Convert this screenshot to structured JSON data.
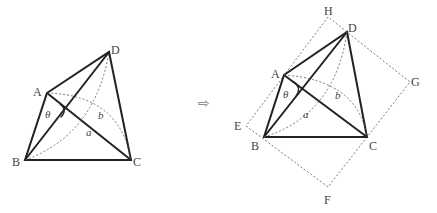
{
  "left_figure": {
    "points": {
      "A": {
        "label": "A",
        "x": 47,
        "y": 93
      },
      "B": {
        "label": "B",
        "x": 25,
        "y": 160
      },
      "C": {
        "label": "C",
        "x": 131,
        "y": 160
      },
      "D": {
        "label": "D",
        "x": 109,
        "y": 52
      }
    },
    "angle_label": "θ",
    "diagonal_a_label": "a",
    "diagonal_b_label": "b"
  },
  "transition_arrow": "⇨",
  "right_figure": {
    "points": {
      "A": {
        "label": "A",
        "x": 284,
        "y": 75
      },
      "B": {
        "label": "B",
        "x": 264,
        "y": 137
      },
      "C": {
        "label": "C",
        "x": 367,
        "y": 137
      },
      "D": {
        "label": "D",
        "x": 347,
        "y": 32
      },
      "E": {
        "label": "E",
        "x": 246,
        "y": 126
      },
      "F": {
        "label": "F",
        "x": 328,
        "y": 187
      },
      "G": {
        "label": "G",
        "x": 410,
        "y": 82
      },
      "H": {
        "label": "H",
        "x": 328,
        "y": 17
      }
    },
    "angle_label": "θ",
    "diagonal_a_label": "a",
    "diagonal_b_label": "b"
  }
}
